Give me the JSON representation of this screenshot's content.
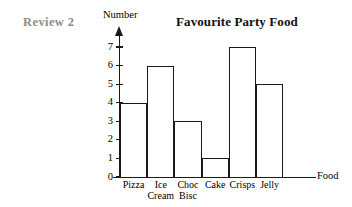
{
  "header": {
    "review_tag": "Review 2",
    "review_tag_color": "#8c8c8c"
  },
  "chart_data": {
    "type": "bar",
    "title": "Favourite Party Food",
    "xlabel": "Food",
    "ylabel": "Number",
    "categories": [
      "Pizza",
      "Ice Cream",
      "Choc Bisc",
      "Cake",
      "Crisps",
      "Jelly"
    ],
    "category_lines": [
      [
        "Pizza"
      ],
      [
        "Ice",
        "Cream"
      ],
      [
        "Choc",
        "Bisc"
      ],
      [
        "Cake"
      ],
      [
        "Crisps"
      ],
      [
        "Jelly"
      ]
    ],
    "values": [
      4,
      6,
      3,
      1,
      7,
      5
    ],
    "ylim": [
      0,
      7
    ],
    "yticks": [
      0,
      1,
      2,
      3,
      4,
      5,
      6,
      7
    ],
    "ytick_labels": [
      "0",
      "1",
      "2",
      "3",
      "4",
      "5",
      "6",
      "7"
    ],
    "grid": false,
    "legend": false,
    "bar_fill": "#ffffff",
    "bar_edge": "#1a1a1a",
    "axis_color": "#1a1a1a"
  }
}
